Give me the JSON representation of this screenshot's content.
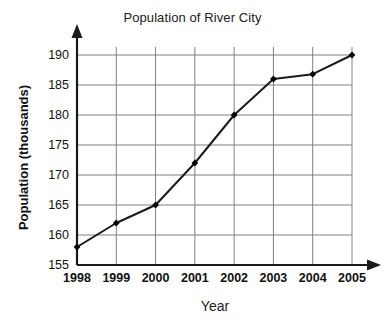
{
  "chart_data": {
    "type": "line",
    "title": "Population of River City",
    "xlabel": "Year",
    "ylabel": "Population (thousands)",
    "categories": [
      "1998",
      "1999",
      "2000",
      "2001",
      "2002",
      "2003",
      "2004",
      "2005"
    ],
    "values": [
      158,
      162,
      165,
      172,
      180,
      186,
      186.8,
      190
    ],
    "x": [
      1998,
      1999,
      2000,
      2001,
      2002,
      2003,
      2004,
      2005
    ],
    "xlim": [
      1998,
      2005
    ],
    "ylim": [
      155,
      190
    ],
    "y_ticks": [
      155,
      160,
      165,
      170,
      175,
      180,
      185,
      190
    ],
    "y_tick_labels": [
      "155",
      "160",
      "165",
      "170",
      "175",
      "180",
      "185",
      "190"
    ],
    "x_ticks": [
      1998,
      1999,
      2000,
      2001,
      2002,
      2003,
      2004,
      2005
    ],
    "x_tick_labels": [
      "1998",
      "1999",
      "2000",
      "2001",
      "2002",
      "2003",
      "2004",
      "2005"
    ],
    "grid": true,
    "grid_color": "#808080",
    "legend": null,
    "legend_position": "none",
    "series": [
      {
        "name": "Population",
        "values": [
          158,
          162,
          165,
          172,
          180,
          186,
          186.8,
          190
        ],
        "line_color": "#1a1a1a",
        "marker": "diamond",
        "marker_color": "#000000"
      }
    ],
    "axis_color": "#1a1a1a",
    "axis_arrows": [
      "y-up",
      "x-right"
    ],
    "background": "#ffffff"
  }
}
